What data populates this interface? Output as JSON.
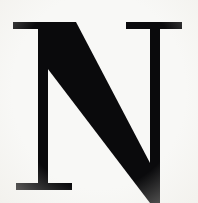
{
  "image": {
    "type": "scanned-letterform",
    "description": "Large black serif capital letter N on off-white paper, cropped at bottom edge",
    "width": 198,
    "height": 203,
    "alt_text": "N"
  },
  "glyph": {
    "character": "N",
    "name": "capital-letter-n",
    "style": "serif",
    "weight": "bold",
    "ink_color": "#0a0a0c",
    "paper_color": "#f8f8f6",
    "cropped_edges": [
      "bottom"
    ]
  },
  "strokes": {
    "left_stem": {
      "name": "left-vertical-stem",
      "x": 38,
      "y_top": 22,
      "y_bottom": 190,
      "width": 10
    },
    "right_stem": {
      "name": "right-vertical-stem",
      "x": 150,
      "y_top": 22,
      "y_bottom": 203,
      "width": 10
    },
    "diagonal": {
      "name": "diagonal-stroke",
      "x_start": 40,
      "y_start": 22,
      "x_end": 160,
      "y_end": 200,
      "thickness": 38
    }
  },
  "serifs": {
    "top_left": {
      "name": "top-left-serif",
      "x": 13,
      "y": 22,
      "width": 57,
      "height": 7
    },
    "top_right": {
      "name": "top-right-serif",
      "x": 126,
      "y": 22,
      "width": 56,
      "height": 7
    },
    "bottom_left": {
      "name": "bottom-left-serif",
      "x": 16,
      "y": 183,
      "width": 56,
      "height": 7
    }
  }
}
